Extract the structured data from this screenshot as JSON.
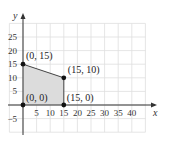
{
  "chart_data": {
    "type": "scatter",
    "title": "",
    "xlabel": "x",
    "ylabel": "y",
    "xlim": [
      -5,
      45
    ],
    "ylim": [
      -10,
      30
    ],
    "grid": true,
    "x_ticks": [
      "5",
      "10",
      "15",
      "20",
      "25",
      "30",
      "35",
      "40"
    ],
    "y_ticks": [
      "25",
      "20",
      "15",
      "10",
      "5",
      "−5"
    ],
    "points": [
      {
        "x": 0,
        "y": 15,
        "label": "(0, 15)"
      },
      {
        "x": 15,
        "y": 10,
        "label": "(15, 10)"
      },
      {
        "x": 0,
        "y": 0,
        "label": "(0, 0)"
      },
      {
        "x": 15,
        "y": 0,
        "label": "(15, 0)"
      }
    ],
    "shaded_region": {
      "vertices": [
        [
          0,
          0
        ],
        [
          0,
          15
        ],
        [
          15,
          10
        ],
        [
          15,
          0
        ]
      ],
      "fill": "#d9d9d9"
    }
  },
  "colors": {
    "grid": "#d8d8d8",
    "axis": "#333333",
    "region": "#dcdcdc",
    "point": "#111111"
  }
}
